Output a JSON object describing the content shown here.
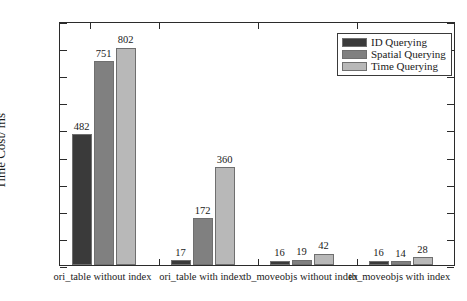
{
  "chart_data": {
    "type": "bar",
    "title": "",
    "xlabel": "",
    "ylabel": "Time Cost/ ms",
    "ylim": [
      0,
      900
    ],
    "ytick_step": 100,
    "yticks": [
      0,
      100,
      200,
      300,
      400,
      500,
      600,
      700,
      800,
      900
    ],
    "grid": false,
    "legend_position": "top-right",
    "categories": [
      "ori_table without index",
      "ori_table with index",
      "tb_moveobjs without index",
      "tb_moveobjs with index"
    ],
    "series": [
      {
        "name": "ID  Querying",
        "color": "#3a3a3a",
        "values": [
          482,
          17,
          16,
          16
        ]
      },
      {
        "name": "Spatial Querying",
        "color": "#808080",
        "values": [
          751,
          172,
          19,
          14
        ]
      },
      {
        "name": "Time Querying",
        "color": "#b8b8b8",
        "values": [
          802,
          360,
          42,
          28
        ]
      }
    ],
    "bar_labels": [
      [
        "482",
        "751",
        "802"
      ],
      [
        "17",
        "172",
        "360"
      ],
      [
        "16",
        "19",
        "42"
      ],
      [
        "16",
        "14",
        "28"
      ]
    ]
  },
  "axis": {
    "y_tick_labels": [
      "900",
      "800",
      "700",
      "600",
      "500",
      "400",
      "300",
      "200",
      "100",
      "0"
    ],
    "y_title": "Time Cost/ ms"
  },
  "legend": {
    "items": [
      {
        "label": "ID  Querying"
      },
      {
        "label": "Spatial Querying"
      },
      {
        "label": "Time Querying"
      }
    ]
  }
}
